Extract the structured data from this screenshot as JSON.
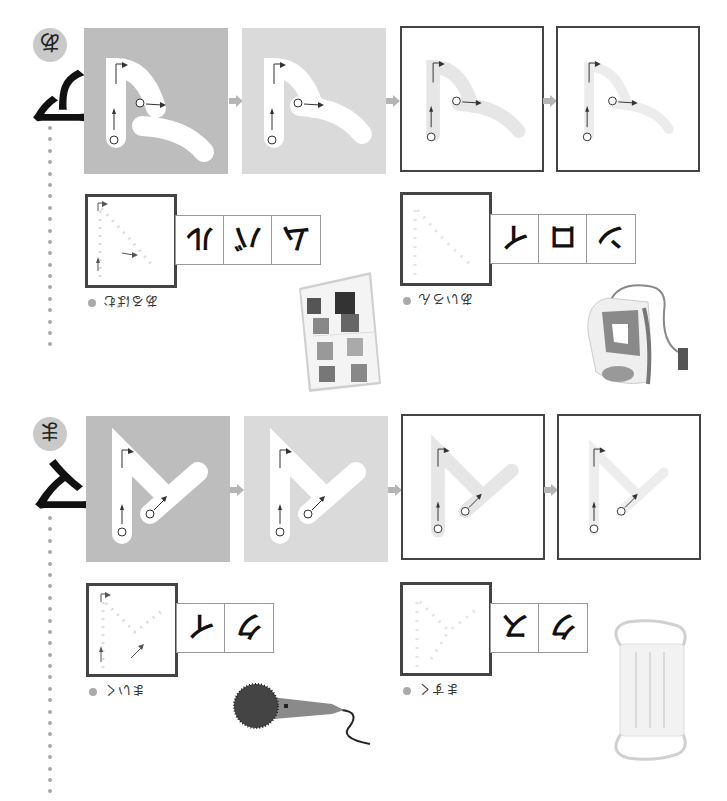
{
  "worksheet": {
    "orientation": "rotated-180",
    "colors": {
      "panel_dark": "#bdbdbd",
      "panel_light": "#dadada",
      "frame": "#444444",
      "guide": "#e6e6e6",
      "dot": "#a8a8a8",
      "arrow": "#b5b5b5"
    },
    "sections": [
      {
        "id": "a",
        "katakana": "ア",
        "hiragana_badge": "あ",
        "stroke_numbers": [
          "①",
          "②"
        ],
        "practice_words": [
          {
            "label": "あるばむ",
            "katakana_cells": [
              "ア",
              "ル",
              "バ",
              "ム"
            ],
            "visible_cells": [
              "ル",
              "バ",
              "ム"
            ],
            "illustration": "photo-album"
          },
          {
            "label": "あいろん",
            "katakana_cells": [
              "ア",
              "イ",
              "ロ",
              "ン"
            ],
            "visible_cells": [
              "イ",
              "ロ",
              "ン"
            ],
            "illustration": "iron"
          }
        ]
      },
      {
        "id": "ma",
        "katakana": "マ",
        "hiragana_badge": "ま",
        "stroke_numbers": [
          "①",
          "②"
        ],
        "practice_words": [
          {
            "label": "まいく",
            "katakana_cells": [
              "マ",
              "イ",
              "ク"
            ],
            "visible_cells": [
              "イ",
              "ク"
            ],
            "illustration": "microphone"
          },
          {
            "label": "ますく",
            "katakana_cells": [
              "マ",
              "ス",
              "ク"
            ],
            "visible_cells": [
              "ス",
              "ク"
            ],
            "illustration": "face-mask"
          }
        ]
      }
    ]
  }
}
